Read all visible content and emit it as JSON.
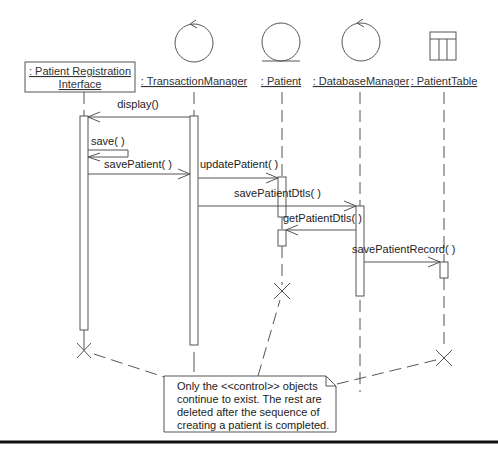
{
  "diagram": {
    "type": "uml-sequence",
    "objects": [
      {
        "id": "pri",
        "label_line1": ": Patient Registration",
        "label_line2": "Interface",
        "kind": "boundary-box"
      },
      {
        "id": "tm",
        "label": ": TransactionManager",
        "kind": "control"
      },
      {
        "id": "pat",
        "label": ": Patient",
        "kind": "entity"
      },
      {
        "id": "dbm",
        "label": ": DatabaseManager",
        "kind": "control"
      },
      {
        "id": "pt",
        "label": ": PatientTable",
        "kind": "table"
      }
    ],
    "messages": [
      {
        "from": "tm",
        "to": "pri",
        "label": "display()"
      },
      {
        "from": "pri",
        "to": "pri",
        "label": "save( )"
      },
      {
        "from": "pri",
        "to": "tm",
        "label": "savePatient( )"
      },
      {
        "from": "tm",
        "to": "pat",
        "label": "updatePatient( )"
      },
      {
        "from": "tm",
        "to": "dbm",
        "label": "savePatientDtls( )"
      },
      {
        "from": "dbm",
        "to": "pat",
        "label": "getPatientDtls( )"
      },
      {
        "from": "dbm",
        "to": "pt",
        "label": "savePatientRecord( )"
      }
    ],
    "destroyed": [
      "pri",
      "pat",
      "pt"
    ],
    "note": {
      "lines": [
        "Only the <<control>> objects",
        "continue to exist. The rest are",
        "deleted after the sequence of",
        "creating a patient is completed."
      ]
    },
    "colors": {
      "stroke": "#555555",
      "text": "#222222",
      "background": "#ffffff"
    }
  }
}
